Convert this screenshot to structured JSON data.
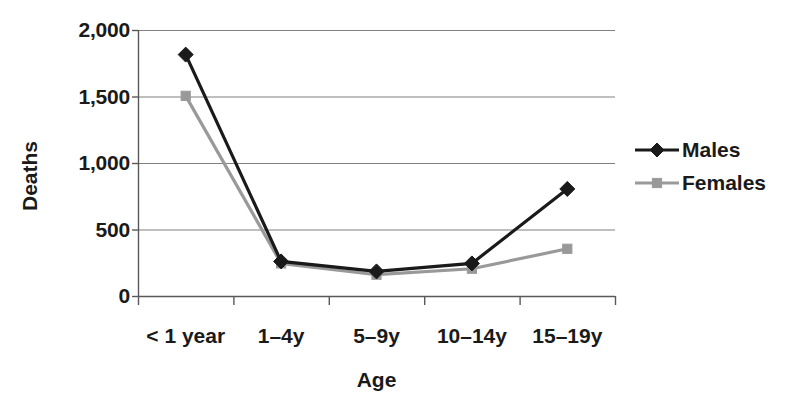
{
  "chart_data": {
    "type": "line",
    "title": "",
    "xlabel": "Age",
    "ylabel": "Deaths",
    "categories": [
      "< 1 year",
      "1–4y",
      "5–9y",
      "10–14y",
      "15–19y"
    ],
    "series": [
      {
        "name": "Males",
        "color": "#1a1a1a",
        "marker": "diamond",
        "values": [
          1815,
          260,
          185,
          245,
          805
        ]
      },
      {
        "name": "Females",
        "color": "#999999",
        "marker": "square",
        "values": [
          1505,
          245,
          160,
          205,
          355
        ]
      }
    ],
    "ylim": [
      0,
      2000
    ],
    "yticks": [
      0,
      500,
      1000,
      1500,
      2000
    ],
    "ytick_labels": [
      "0",
      "500",
      "1,000",
      "1,500",
      "2,000"
    ],
    "grid": "horizontal",
    "legend_position": "right"
  },
  "axes": {
    "y_title": "Deaths",
    "x_title": "Age"
  },
  "legend": {
    "entries": [
      {
        "label": "Males"
      },
      {
        "label": "Females"
      }
    ]
  },
  "colors": {
    "males": "#1a1a1a",
    "females": "#999999",
    "gridline": "#808080",
    "axis": "#595959",
    "background": "#ffffff"
  }
}
